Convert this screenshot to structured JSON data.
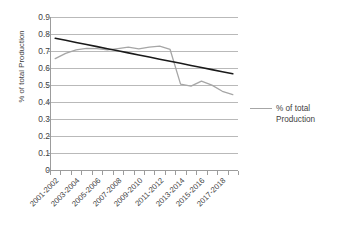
{
  "chart_data": {
    "type": "line",
    "title": "",
    "xlabel": "",
    "ylabel": "% of total Production",
    "ylim": [
      0,
      0.9
    ],
    "ytick_values": [
      0,
      0.1,
      0.2,
      0.3,
      0.4,
      0.5,
      0.6,
      0.7,
      0.8,
      0.9
    ],
    "ytick_labels": [
      "0",
      "0.1",
      "0.2",
      "0.3",
      "0.4",
      "0.5",
      "0.6",
      "0.7",
      "0.8",
      "0.9"
    ],
    "grid": true,
    "grid_axis": "y",
    "legend_position": "right",
    "categories": [
      "2001-2002",
      "2002-2003",
      "2003-2004",
      "2004-2005",
      "2005-2006",
      "2006-2007",
      "2007-2008",
      "2008-2009",
      "2009-2010",
      "2010-2011",
      "2011-2012",
      "2012-2013",
      "2013-2014",
      "2014-2015",
      "2015-2016",
      "2016-2017",
      "2017-2018",
      "2018-2019"
    ],
    "xtick_labels_shown": [
      "2001-2002",
      "2003-2004",
      "2005-2006",
      "2007-2008",
      "2009-2010",
      "2011-2012",
      "2013-2014",
      "2015-2016",
      "2017-2018"
    ],
    "series": [
      {
        "name": "% of total Production",
        "color": "#a6a6a6",
        "type": "line",
        "values": [
          0.655,
          0.686,
          0.706,
          0.716,
          0.714,
          0.706,
          0.714,
          0.723,
          0.713,
          0.723,
          0.729,
          0.709,
          0.505,
          0.493,
          0.523,
          0.499,
          0.463,
          0.443
        ]
      },
      {
        "name": "Linear trendline",
        "color": "#1a1a1a",
        "type": "trendline",
        "values": [
          0.775,
          0.7627,
          0.7504,
          0.7381,
          0.7258,
          0.7135,
          0.7012,
          0.6889,
          0.6766,
          0.6643,
          0.652,
          0.6397,
          0.6274,
          0.6151,
          0.6028,
          0.5905,
          0.5782,
          0.5659
        ]
      }
    ],
    "legend": [
      {
        "label_line1": "% of total",
        "label_line2": "Production",
        "color": "#a6a6a6"
      }
    ]
  }
}
